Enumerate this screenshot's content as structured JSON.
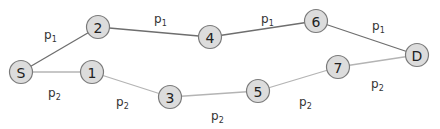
{
  "diagram": {
    "title": "",
    "colors": {
      "node_fill": "#dcdcdc",
      "node_stroke": "#7a7a7a",
      "path1_edge": "#6e6e6e",
      "path2_edge": "#b4b4b4",
      "text": "#222222"
    },
    "nodes": [
      {
        "id": "S",
        "label": "S",
        "x": 21,
        "y": 72
      },
      {
        "id": "1",
        "label": "1",
        "x": 92,
        "y": 72
      },
      {
        "id": "2",
        "label": "2",
        "x": 98,
        "y": 27
      },
      {
        "id": "3",
        "label": "3",
        "x": 170,
        "y": 97
      },
      {
        "id": "4",
        "label": "4",
        "x": 210,
        "y": 37
      },
      {
        "id": "5",
        "label": "5",
        "x": 258,
        "y": 91
      },
      {
        "id": "6",
        "label": "6",
        "x": 316,
        "y": 21
      },
      {
        "id": "7",
        "label": "7",
        "x": 338,
        "y": 67
      },
      {
        "id": "D",
        "label": "D",
        "x": 417,
        "y": 55
      }
    ],
    "edges": [
      {
        "from": "S",
        "to": "2",
        "path": "p1"
      },
      {
        "from": "2",
        "to": "4",
        "path": "p1"
      },
      {
        "from": "4",
        "to": "6",
        "path": "p1"
      },
      {
        "from": "6",
        "to": "D",
        "path": "p1"
      },
      {
        "from": "S",
        "to": "1",
        "path": "p2"
      },
      {
        "from": "1",
        "to": "3",
        "path": "p2"
      },
      {
        "from": "3",
        "to": "5",
        "path": "p2"
      },
      {
        "from": "5",
        "to": "7",
        "path": "p2"
      },
      {
        "from": "7",
        "to": "D",
        "path": "p2"
      }
    ],
    "edge_labels": [
      {
        "base": "p",
        "sub": "1",
        "x": 44,
        "y": 39
      },
      {
        "base": "p",
        "sub": "1",
        "x": 154,
        "y": 23
      },
      {
        "base": "p",
        "sub": "1",
        "x": 261,
        "y": 23
      },
      {
        "base": "p",
        "sub": "1",
        "x": 372,
        "y": 30
      },
      {
        "base": "p",
        "sub": "2",
        "x": 48,
        "y": 97
      },
      {
        "base": "p",
        "sub": "2",
        "x": 116,
        "y": 106
      },
      {
        "base": "p",
        "sub": "2",
        "x": 211,
        "y": 120
      },
      {
        "base": "p",
        "sub": "2",
        "x": 299,
        "y": 106
      },
      {
        "base": "p",
        "sub": "2",
        "x": 371,
        "y": 88
      }
    ]
  }
}
